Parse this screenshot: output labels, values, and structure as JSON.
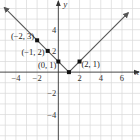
{
  "chart_data": {
    "type": "line",
    "title": "",
    "function": "y = |x - 1|",
    "xlabel": "x",
    "ylabel": "y",
    "xlim": [
      -5.5,
      7.7
    ],
    "ylim": [
      -6.4,
      6.8
    ],
    "grid": true,
    "x_ticks": [
      -4,
      -2,
      2,
      4,
      6
    ],
    "x_tick_labels": [
      "-4",
      "-2",
      "2",
      "4",
      "6"
    ],
    "y_ticks": [
      4,
      2,
      -2,
      -4
    ],
    "y_tick_labels": [
      "4",
      "2",
      "-2",
      "-4"
    ],
    "series": [
      {
        "name": "y = |x - 1|",
        "x": [
          -5.1,
          1,
          6.6
        ],
        "y": [
          6.1,
          0,
          5.6
        ],
        "arrows": true,
        "color": "#555555"
      }
    ],
    "labeled_points": [
      {
        "x": -2,
        "y": 3,
        "label": "(-2, 3)"
      },
      {
        "x": -1,
        "y": 2,
        "label": "(-1, 2)"
      },
      {
        "x": 0,
        "y": 1,
        "label": "(0, 1)"
      },
      {
        "x": 2,
        "y": 1,
        "label": "(2, 1)"
      }
    ],
    "unlabeled_points": [
      {
        "x": 1,
        "y": 0
      }
    ]
  }
}
